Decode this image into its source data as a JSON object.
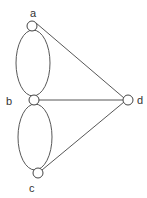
{
  "diagram": {
    "type": "graph",
    "colors": {
      "stroke": "#444444",
      "node_fill": "#ffffff",
      "label": "#333333"
    },
    "nodes": [
      {
        "id": "a",
        "label": "a",
        "cx": 32,
        "cy": 26,
        "r": 5,
        "label_x": 33,
        "label_y": 16
      },
      {
        "id": "b",
        "label": "b",
        "cx": 34,
        "cy": 100,
        "r": 5,
        "label_x": 9,
        "label_y": 105
      },
      {
        "id": "c",
        "label": "c",
        "cx": 38,
        "cy": 173,
        "r": 5,
        "label_x": 32,
        "label_y": 191
      },
      {
        "id": "d",
        "label": "d",
        "cx": 128,
        "cy": 100,
        "r": 5,
        "label_x": 140,
        "label_y": 105
      }
    ],
    "edges": [
      {
        "from": "a",
        "to": "b",
        "kind": "curved-left"
      },
      {
        "from": "a",
        "to": "b",
        "kind": "curved-right"
      },
      {
        "from": "b",
        "to": "c",
        "kind": "curved-left"
      },
      {
        "from": "b",
        "to": "c",
        "kind": "curved-right"
      },
      {
        "from": "a",
        "to": "d",
        "kind": "straight"
      },
      {
        "from": "b",
        "to": "d",
        "kind": "straight"
      },
      {
        "from": "c",
        "to": "d",
        "kind": "straight"
      }
    ]
  }
}
